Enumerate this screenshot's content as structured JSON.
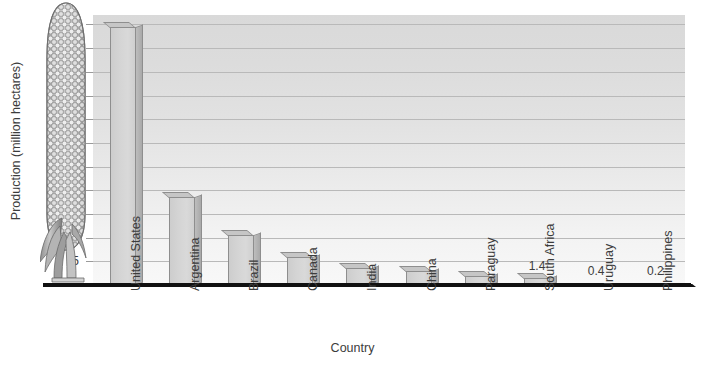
{
  "chart_data": {
    "type": "bar",
    "title": "",
    "xlabel": "Country",
    "ylabel": "Production (million hectares)",
    "categories": [
      "United States",
      "Argentina",
      "Brazil",
      "Canada",
      "India",
      "China",
      "Paraguay",
      "South Africa",
      "Uruguay",
      "Philippines"
    ],
    "values": [
      54.5,
      18.5,
      10.5,
      6.0,
      3.5,
      3.0,
      2.0,
      1.4,
      0.4,
      0.2
    ],
    "point_labels": [
      "",
      "",
      "",
      "",
      "",
      "",
      "",
      "1.4",
      "0.4",
      "0.2"
    ],
    "ylim": [
      0,
      57
    ],
    "yticks": [
      5,
      10,
      15,
      20,
      25,
      30,
      35,
      40,
      45,
      50,
      55
    ],
    "ytick_labels": [
      "5",
      "10",
      "15",
      "20",
      "25",
      "30",
      "35",
      "40",
      "45",
      "50",
      "55"
    ],
    "grid": true,
    "legend": false,
    "legend_position": "none",
    "orientation": "vertical",
    "style": {
      "bar_face_color": "#d4d4d4",
      "bar_side_color": "#b0b0b0",
      "bar_outline_color": "#8e8e8e",
      "plot_background_top": "#d9d9d9",
      "plot_background_bottom": "#f8f8f8",
      "gridline_color": "#b9b9b9",
      "axis_color": "#111111",
      "text_color": "#3c3c3c"
    }
  },
  "decoration": {
    "corn_illustration": "corn-cob-with-husk"
  }
}
